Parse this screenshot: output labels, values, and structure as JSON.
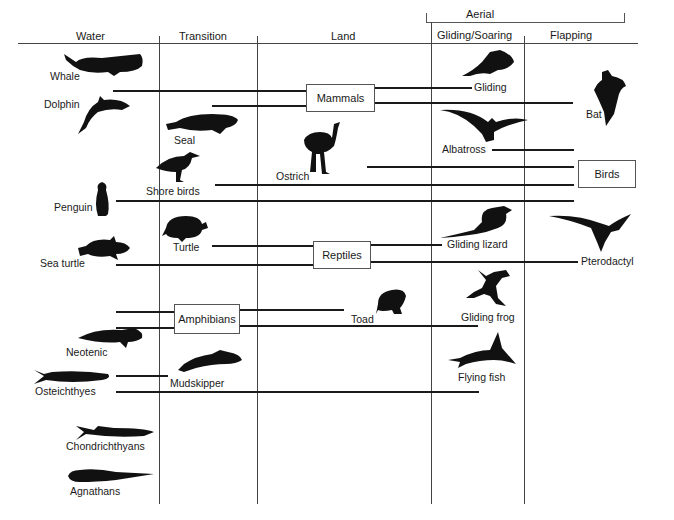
{
  "diagram": {
    "header": {
      "aerial_group": "Aerial",
      "columns": [
        "Water",
        "Transition",
        "Land",
        "Gliding/Soaring",
        "Flapping"
      ]
    },
    "groups": {
      "mammals": "Mammals",
      "birds": "Birds",
      "reptiles": "Reptiles",
      "amphibians": "Amphibians"
    },
    "animals": {
      "whale": "Whale",
      "dolphin": "Dolphin",
      "seal": "Seal",
      "gliding_mammal": "Gliding",
      "bat": "Bat",
      "albatross": "Albatross",
      "ostrich": "Ostrich",
      "shore_birds": "Shore birds",
      "penguin": "Penguin",
      "turtle": "Turtle",
      "sea_turtle": "Sea turtle",
      "gliding_lizard": "Gliding lizard",
      "pterodactyl": "Pterodactyl",
      "toad": "Toad",
      "gliding_frog": "Gliding frog",
      "neotenic": "Neotenic",
      "mudskipper": "Mudskipper",
      "osteichthyes": "Osteichthyes",
      "flying_fish": "Flying fish",
      "chondrichthyans": "Chondrichthyans",
      "agnathans": "Agnathans"
    }
  }
}
